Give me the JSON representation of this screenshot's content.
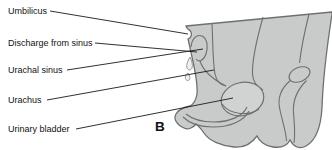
{
  "figure": {
    "panel_letter": "B",
    "labels": [
      {
        "id": "umbilicus",
        "text": "Umbilicus"
      },
      {
        "id": "discharge-from-sinus",
        "text": "Discharge from sinus"
      },
      {
        "id": "urachal-sinus",
        "text": "Urachal sinus"
      },
      {
        "id": "urachus",
        "text": "Urachus"
      },
      {
        "id": "urinary-bladder",
        "text": "Urinary bladder"
      }
    ],
    "colors": {
      "background": "#ffffff",
      "body_fill": "#c9cbca",
      "bladder_fill": "#d1d3d2",
      "outline": "#6e706f",
      "leader_line": "#1a1a1a",
      "text": "#111111"
    }
  }
}
